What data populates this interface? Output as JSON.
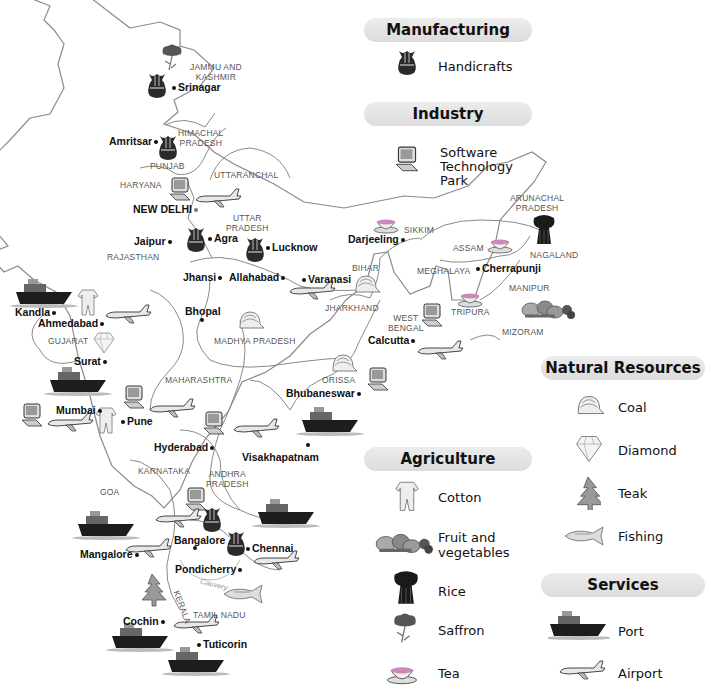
{
  "legend": {
    "manufacturing": {
      "title": "Manufacturing",
      "items": [
        {
          "icon": "handicrafts-vase-icon",
          "label": "Handicrafts"
        }
      ]
    },
    "industry": {
      "title": "Industry",
      "items": [
        {
          "icon": "computer-icon",
          "label": "Software Technology Park"
        }
      ]
    },
    "natural_resources": {
      "title": "Natural Resources",
      "items": [
        {
          "icon": "coal-helmet-icon",
          "label": "Coal"
        },
        {
          "icon": "diamond-icon",
          "label": "Diamond"
        },
        {
          "icon": "teak-tree-icon",
          "label": "Teak"
        },
        {
          "icon": "fish-icon",
          "label": "Fishing"
        }
      ]
    },
    "agriculture": {
      "title": "Agriculture",
      "items": [
        {
          "icon": "cotton-garment-icon",
          "label": "Cotton"
        },
        {
          "icon": "fruit-vegetables-icon",
          "label": "Fruit and vegetables"
        },
        {
          "icon": "rice-sheaf-icon",
          "label": "Rice"
        },
        {
          "icon": "saffron-flower-icon",
          "label": "Saffron"
        },
        {
          "icon": "tea-cup-icon",
          "label": "Tea"
        }
      ]
    },
    "services": {
      "title": "Services",
      "items": [
        {
          "icon": "ship-icon",
          "label": "Port"
        },
        {
          "icon": "airplane-icon",
          "label": "Airport"
        }
      ]
    }
  },
  "legend_lines": {
    "software_1": "Software",
    "software_2": "Technology",
    "software_3": "Park",
    "fruit_1": "Fruit and",
    "fruit_2": "vegetables"
  },
  "states": {
    "jk_1": "JAMMU AND",
    "jk_2": "KASHMIR",
    "hp_1": "HIMACHAL",
    "hp_2": "PRADESH",
    "punjab": "PUNJAB",
    "haryana": "HARYANA",
    "uttaranchal": "UTTARANCHAL",
    "up_1": "UTTAR",
    "up_2": "PRADESH",
    "rajasthan": "RAJASTHAN",
    "sikkim": "SIKKIM",
    "arunachal_1": "ARUNACHAL",
    "arunachal_2": "PRADESH",
    "assam": "ASSAM",
    "nagaland": "NAGALAND",
    "meghalaya": "MEGHALAYA",
    "manipur": "MANIPUR",
    "bihar": "BIHAR",
    "jharkhand": "JHARKHAND",
    "wb_1": "WEST",
    "wb_2": "BENGAL",
    "tripura": "TRIPURA",
    "mizoram": "MIZORAM",
    "gujarat": "GUJARAT",
    "mp": "MADHYA PRADESH",
    "maharashtra": "MAHARASHTRA",
    "orissa": "ORISSA",
    "karnataka": "KARNATAKA",
    "ap_1": "ANDHRA",
    "ap_2": "PRADESH",
    "goa": "GOA",
    "kerala": "KERALA",
    "tamil_nadu": "TAMIL NADU"
  },
  "river": "Cauvery",
  "cities": {
    "srinagar": "Srinagar",
    "amritsar": "Amritsar",
    "new_delhi": "NEW DELHI",
    "jaipur": "Jaipur",
    "agra": "Agra",
    "lucknow": "Lucknow",
    "jhansi": "Jhansi",
    "allahabad": "Allahabad",
    "varanasi": "Varanasi",
    "darjeeling": "Darjeeling",
    "cherrapunji": "Cherrapunji",
    "kandla": "Kandla",
    "ahmedabad": "Ahmedabad",
    "bhopal": "Bhopal",
    "surat": "Surat",
    "calcutta": "Calcutta",
    "mumbai": "Mumbai",
    "pune": "Pune",
    "bhubaneswar": "Bhubaneswar",
    "hyderabad": "Hyderabad",
    "visakhapatnam": "Visakhapatnam",
    "bangalore": "Bangalore",
    "chennai": "Chennai",
    "mangalore": "Mangalore",
    "pondicherry": "Pondicherry",
    "cochin": "Cochin",
    "tuticorin": "Tuticorin"
  },
  "colors": {
    "legend_header_bg": "#e3e3e3",
    "border": "#8a8a8a",
    "text": "#111111"
  }
}
